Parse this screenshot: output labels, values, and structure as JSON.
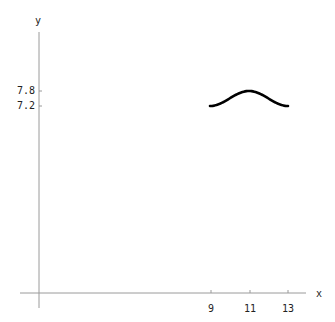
{
  "chart_data": {
    "type": "line",
    "title": "",
    "xlabel": "x",
    "ylabel": "y",
    "x_ticks": [
      "9",
      "11",
      "13"
    ],
    "y_ticks": [
      "7.8",
      "7.2"
    ],
    "series": [
      {
        "name": "curve",
        "x": [
          9,
          9.5,
          10,
          10.5,
          11,
          11.5,
          12,
          12.5,
          13
        ],
        "y": [
          7.2,
          7.24,
          7.4,
          7.68,
          7.8,
          7.68,
          7.4,
          7.24,
          7.2
        ]
      }
    ],
    "xlim": [
      0,
      14
    ],
    "grid": false,
    "color": "#000000"
  },
  "axes": {
    "x_label": "x",
    "y_label": "y",
    "x_tick_labels": [
      "9",
      "11",
      "13"
    ],
    "y_tick_labels": [
      "7.8",
      "7.2"
    ]
  }
}
